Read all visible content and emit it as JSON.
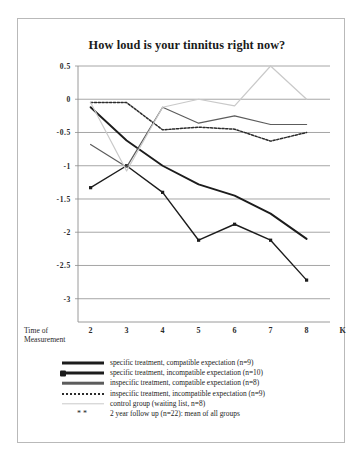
{
  "chart_data": {
    "type": "line",
    "title": "How loud is your tinnitus right now?",
    "xlabel": "Time of Measurement",
    "ylabel": "",
    "x": [
      2,
      3,
      4,
      5,
      6,
      7,
      8
    ],
    "xticklabels": [
      "2",
      "3",
      "4",
      "5",
      "6",
      "7",
      "8",
      "K"
    ],
    "yticklabels": [
      "0.5",
      "0",
      "-0.5",
      "-1",
      "-1.5",
      "-2",
      "-2.5",
      "-3"
    ],
    "yticks": [
      0.5,
      0,
      -0.5,
      -1,
      -1.5,
      -2,
      -2.5,
      -3
    ],
    "ylim": [
      -3.35,
      0.5
    ],
    "xlim": [
      1.65,
      8.65
    ],
    "grid": true,
    "legend_position": "below",
    "series": [
      {
        "name": "specific treatment, compatible expectation (n=9)",
        "style": "solid-thick-black",
        "color": "#1c1c1c",
        "values": [
          -0.12,
          -0.62,
          -1.0,
          -1.28,
          -1.45,
          -1.72,
          -2.1
        ]
      },
      {
        "name": "specific treatment, incompatible expectation (n=10)",
        "style": "solid-black-markers",
        "color": "#1c1c1c",
        "values": [
          -1.33,
          -1.0,
          -1.4,
          -2.12,
          -1.88,
          -2.12,
          -2.72
        ]
      },
      {
        "name": "inspecific treatment, compatible expectation (n=8)",
        "style": "solid-gray",
        "color": "#5c5c5c",
        "values": [
          -0.68,
          -1.02,
          -0.12,
          -0.36,
          -0.25,
          -0.38,
          -0.38
        ]
      },
      {
        "name": "inspecific treatment, incompatible expectation (n=9)",
        "style": "dotted-black",
        "color": "#2b2b2b",
        "values": [
          -0.05,
          -0.05,
          -0.46,
          -0.42,
          -0.45,
          -0.63,
          -0.5
        ]
      },
      {
        "name": "control group (waiting list, n=8)",
        "style": "solid-lightgray",
        "color": "#c9c9c9",
        "values": [
          -0.05,
          -1.08,
          -0.12,
          0.0,
          -0.1,
          0.5,
          0.0
        ]
      },
      {
        "name": "2 year follow up (n=22): mean of all groups",
        "style": "stars-marker",
        "color": "#1c1c1c",
        "x": [
          9
        ],
        "values": [
          -2.0
        ]
      }
    ]
  },
  "legend": {
    "rows": [
      {
        "label": "specific treatment, compatible expectation (n=9)"
      },
      {
        "label": "specific treatment, incompatible expectation (n=10)"
      },
      {
        "label": "inspecific treatment, compatible expectation (n=8)"
      },
      {
        "label": "inspecific treatment, incompatible expectation (n=9)"
      },
      {
        "label": "control group (waiting list, n=8)"
      },
      {
        "label": "2 year follow up (n=22): mean of all groups",
        "marker": "**"
      }
    ]
  }
}
